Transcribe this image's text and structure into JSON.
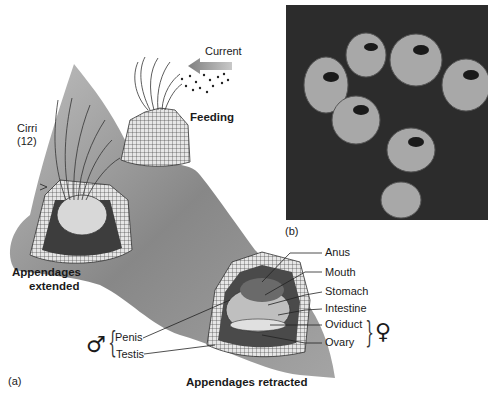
{
  "figure": {
    "panel_a_label": "(a)",
    "panel_b_label": "(b)",
    "current_label": "Current",
    "feeding_label": "Feeding",
    "cirri_label_line1": "Cirri",
    "cirri_label_line2": "(12)",
    "extended_label_line1": "Appendages",
    "extended_label_line2": "extended",
    "retracted_label": "Appendages retracted",
    "male_symbol": "♂",
    "female_symbol": "♀",
    "male_parts": [
      "Penis",
      "Testis"
    ],
    "female_side_parts": [
      "Anus",
      "Mouth",
      "Stomach",
      "Intestine",
      "Oviduct",
      "Ovary"
    ],
    "colors": {
      "background": "#ffffff",
      "rock": "#8c8c8c",
      "rock_dark": "#5a5a5a",
      "shell": "#d9d9d9",
      "photo_bg": "#2c2c2c",
      "arrow": "#9a9a9a",
      "text": "#1a1a1a"
    }
  }
}
